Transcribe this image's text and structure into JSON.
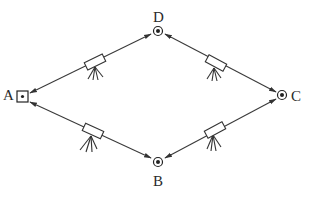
{
  "diagram": {
    "type": "survey-traverse",
    "points": [
      {
        "id": "A",
        "label": "A",
        "marker": "square-with-dot",
        "x": 22,
        "y": 97
      },
      {
        "id": "D",
        "label": "D",
        "marker": "circle-with-dot",
        "x": 158,
        "y": 31
      },
      {
        "id": "C",
        "label": "C",
        "marker": "circle-with-dot",
        "x": 282,
        "y": 95
      },
      {
        "id": "B",
        "label": "B",
        "marker": "circle-with-dot",
        "x": 158,
        "y": 162
      }
    ],
    "legs": [
      {
        "from": "A",
        "to": "D",
        "instrument": "theodolite-on-tripod",
        "arrows": "both-ends"
      },
      {
        "from": "D",
        "to": "C",
        "instrument": "theodolite-on-tripod",
        "arrows": "both-ends"
      },
      {
        "from": "A",
        "to": "B",
        "instrument": "theodolite-on-tripod",
        "arrows": "both-ends"
      },
      {
        "from": "B",
        "to": "C",
        "instrument": "theodolite-on-tripod",
        "arrows": "both-ends"
      }
    ],
    "colors": {
      "stroke": "#333333",
      "background": "#ffffff"
    }
  }
}
